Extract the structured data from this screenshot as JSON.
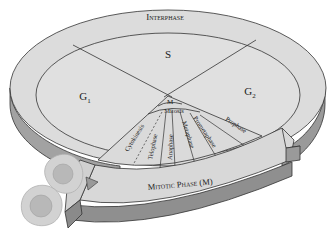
{
  "diagram": {
    "outer_ring_label": "Interphase",
    "interphase_stages": [
      {
        "id": "g1",
        "label": "G",
        "subscript": "1"
      },
      {
        "id": "s",
        "label": "S",
        "subscript": ""
      },
      {
        "id": "g2",
        "label": "G",
        "subscript": "2"
      }
    ],
    "m_label": "M",
    "mitosis_label": "Mitosis",
    "mitotic_sub_phases": [
      "Cytokinesis",
      "Telophase",
      "Anaphase",
      "Metaphase",
      "Prometaphase",
      "Prophase"
    ],
    "mitotic_phase_label": "Mitotic Phase (M)",
    "daughter_cells_count": 2
  },
  "colors": {
    "top_surface": "#dcdcdc",
    "side_face": "#a2a2a2",
    "side_dark": "#8c8c8c",
    "outline": "#333333",
    "cell_body": "#d2d2d2",
    "cell_nucleus": "#b8b8b8",
    "background": "#ffffff"
  }
}
